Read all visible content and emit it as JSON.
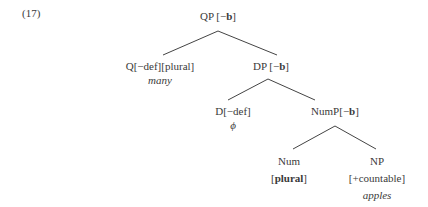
{
  "example": {
    "number": "(17)"
  },
  "tree": {
    "qp": {
      "cat": "QP ",
      "feat_open": "[−",
      "feat_bold": "b",
      "feat_close": "]"
    },
    "q": {
      "label": "Q[−def][plural]",
      "lexical": "many"
    },
    "dp": {
      "cat": "DP ",
      "feat_open": "[−",
      "feat_bold": "b",
      "feat_close": "]"
    },
    "d": {
      "label": "D[−def]",
      "lexical": "ϕ"
    },
    "nump": {
      "cat": "NumP",
      "feat_open": "[−",
      "feat_bold": "b",
      "feat_close": "]"
    },
    "num": {
      "label": "Num",
      "feat_open": "[",
      "feat_bold": "plural",
      "feat_close": "]"
    },
    "np": {
      "label": "NP",
      "feature": "[+countable]",
      "lexical": "apples"
    }
  },
  "edges": [
    {
      "from": "qp",
      "to": "q"
    },
    {
      "from": "qp",
      "to": "dp"
    },
    {
      "from": "dp",
      "to": "d"
    },
    {
      "from": "dp",
      "to": "nump"
    },
    {
      "from": "nump",
      "to": "num"
    },
    {
      "from": "nump",
      "to": "np"
    }
  ]
}
